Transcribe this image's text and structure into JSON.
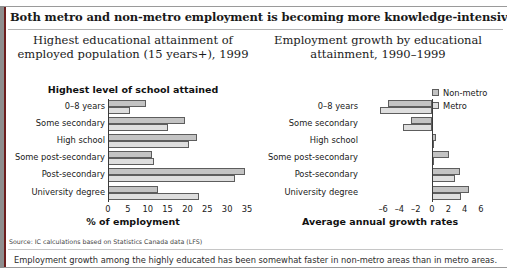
{
  "headline": "Both metro and non-metro employment is becoming more knowledge-intensive ...",
  "left_chart_title": "Highest educational attainment of employed population (15 years+), 1999",
  "right_chart_title": "Employment growth by educational attainment, 1990–1999",
  "left_subtitle": "Highest level of school attained",
  "legend": [
    {
      "key": "nonmetro",
      "label": "Non-metro",
      "color": "#c3c3c3"
    },
    {
      "key": "metro",
      "label": "Metro",
      "color": "#dedede"
    }
  ],
  "source": "Source: IC calculations based on Statistics Canada data (LFS)",
  "caption": "Employment growth among the highly educated has been somewhat faster in non-metro areas than in metro areas.",
  "chart_data": [
    {
      "id": "left",
      "type": "bar",
      "orientation": "horizontal",
      "title": "Highest educational attainment of employed population (15 years+), 1999",
      "subtitle": "Highest level of school attained",
      "xlabel": "% of employment",
      "ylabel": "",
      "xlim": [
        0,
        35
      ],
      "xticks": [
        0,
        5,
        10,
        15,
        20,
        25,
        30,
        35
      ],
      "grid": false,
      "legend_position": "none",
      "categories": [
        "0–8 years",
        "Some secondary",
        "High school",
        "Some post-secondary",
        "Post-secondary",
        "University degree"
      ],
      "series": [
        {
          "name": "Non-metro",
          "values": [
            9.5,
            19.5,
            22.5,
            11.0,
            34.5,
            12.5
          ]
        },
        {
          "name": "Metro",
          "values": [
            5.5,
            15.0,
            20.5,
            11.5,
            32.0,
            23.0
          ]
        }
      ]
    },
    {
      "id": "right",
      "type": "bar",
      "orientation": "horizontal",
      "title": "Employment growth by educational attainment, 1990–1999",
      "xlabel": "Average annual growth rates",
      "ylabel": "",
      "xlim": [
        -7,
        7
      ],
      "xticks": [
        -6,
        -4,
        -2,
        0,
        2,
        4,
        6
      ],
      "grid": false,
      "legend_position": "top-right",
      "categories": [
        "0–8 years",
        "Some secondary",
        "High school",
        "Some post-secondary",
        "Post-secondary",
        "University degree"
      ],
      "series": [
        {
          "name": "Non-metro",
          "values": [
            -5.4,
            -2.6,
            0.5,
            2.1,
            3.4,
            4.6
          ]
        },
        {
          "name": "Metro",
          "values": [
            -6.4,
            -3.6,
            0.1,
            0.1,
            2.8,
            3.6
          ]
        }
      ]
    }
  ],
  "left_axis_title": "% of employment",
  "right_axis_title": "Average annual growth rates"
}
